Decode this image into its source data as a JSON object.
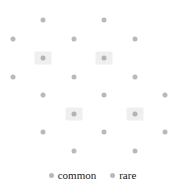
{
  "chart_data": {
    "type": "scatter",
    "title": "",
    "xlabel": "",
    "ylabel": "",
    "xlim": [
      0,
      185
    ],
    "ylim": [
      0,
      162
    ],
    "grid": false,
    "legend_position": "bottom-center",
    "background_color": "#ffffff",
    "marker_color": "#b9b9b9",
    "highlight_color": "#efefef",
    "series": [
      {
        "name": "common",
        "marker_color": "#b9b9b9",
        "highlighted": false,
        "count": 18,
        "points": [
          {
            "x": 43,
            "y": 20
          },
          {
            "x": 104,
            "y": 20
          },
          {
            "x": 13,
            "y": 39
          },
          {
            "x": 74,
            "y": 39
          },
          {
            "x": 135,
            "y": 39
          },
          {
            "x": 13,
            "y": 77
          },
          {
            "x": 74,
            "y": 77
          },
          {
            "x": 135,
            "y": 77
          },
          {
            "x": 43,
            "y": 95
          },
          {
            "x": 104,
            "y": 95
          },
          {
            "x": 165,
            "y": 95
          },
          {
            "x": 43,
            "y": 132
          },
          {
            "x": 104,
            "y": 132
          },
          {
            "x": 165,
            "y": 132
          },
          {
            "x": 74,
            "y": 151
          },
          {
            "x": 135,
            "y": 151
          }
        ]
      },
      {
        "name": "rare",
        "marker_color": "#b3b3b3",
        "highlighted": true,
        "count": 4,
        "points": [
          {
            "x": 43,
            "y": 58
          },
          {
            "x": 104,
            "y": 58
          },
          {
            "x": 74,
            "y": 114
          },
          {
            "x": 135,
            "y": 114
          }
        ]
      }
    ],
    "legend": [
      {
        "label": "common",
        "color": "#b9b9b9"
      },
      {
        "label": "rare",
        "color": "#b9b9b9"
      }
    ]
  }
}
